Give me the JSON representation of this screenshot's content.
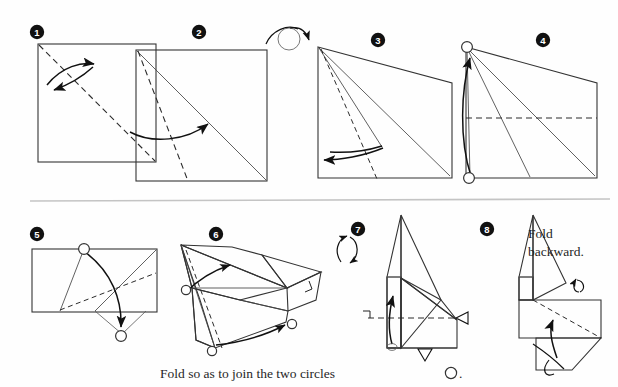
{
  "figure": {
    "type": "origami-diagram",
    "step_count": 8,
    "background_color": "#fefefe",
    "paper_front_color": "#ffffff",
    "paper_back_color": "#c8c8c8",
    "line_color": "#333333",
    "divider_color": "#c4c4c4"
  },
  "steps": [
    {
      "number": "1",
      "badge": "❶",
      "shape": "square",
      "description": "Square sheet with dashed diagonal valley fold from top-left to bottom-right; curved arrow folds corner over.",
      "markers": [],
      "arrows": [
        "double-curve-left"
      ]
    },
    {
      "number": "2",
      "badge": "❷",
      "shape": "square",
      "description": "Square with existing diagonal crease and a new dashed fold line from the top-left corner; curved arrow folds edge to the crease.",
      "markers": [],
      "arrows": [
        "curve-right-up"
      ]
    },
    {
      "number": "3",
      "badge": "❸",
      "shape": "trapezoid",
      "description": "Shaded trapezoid showing the back of the paper; dashed fold line and curved arrow folding a flap to the left.",
      "markers": [],
      "arrows": [
        "curve-left"
      ]
    },
    {
      "number": "4",
      "badge": "❹",
      "shape": "trapezoid",
      "description": "Shaded trapezoid with two open circles at top-left and bottom-left; arrow joins the bottom circle to the top circle; horizontal dashed fold line.",
      "markers": [
        "circle-top-left",
        "circle-bottom-left"
      ],
      "arrows": [
        "curve-up-to-circle"
      ]
    },
    {
      "number": "5",
      "badge": "❺",
      "shape": "rectangle",
      "description": "Horizontal rectangle with an open circle at the top edge and a second open circle below the sheet; arrow joins them. Dashed diagonal fold line present.",
      "markers": [
        "circle-top",
        "circle-bottom"
      ],
      "arrows": [
        "curve-down-to-circle"
      ]
    },
    {
      "number": "6",
      "badge": "❻",
      "shape": "three-dimensional-fold",
      "description": "Partly collapsed three-dimensional model with shaded back surfaces; arrows show flaps swinging, open circles mark the points to be joined, right-angle mark on the right flap.",
      "markers": [
        "circle-left",
        "circle-bottom",
        "circle-right",
        "right-angle"
      ],
      "arrows": [
        "curve-up-left",
        "curve-right-lower"
      ]
    },
    {
      "number": "7",
      "badge": "❼",
      "shape": "folded-model-side-view",
      "description": "Side view of the model with rotate symbol; horizontal dashed fold line with right-angle mark, a hidden-fold arrow pointing up, an open arrowhead at the right and a valley arrowhead at the bottom.",
      "markers": [
        "rotate-symbol",
        "right-angle",
        "open-arrowhead-right",
        "valley-arrowhead-bottom"
      ],
      "arrows": [
        "inside-reverse-up"
      ]
    },
    {
      "number": "8",
      "badge": "❽",
      "shape": "folded-model-side-view",
      "description": "Side view with a dashed mountain fold line running to the lower right; looping arrows indicate folding the flaps behind the model.",
      "markers": [
        "loop-arrow-top",
        "loop-arrow-bottom"
      ],
      "arrows": [
        "fold-back-up",
        "fold-back-loop"
      ],
      "note": "Fold\nbackward."
    }
  ],
  "annotations": {
    "turn_over_symbol": "turn-over-arrow",
    "rotate_symbol": "rotate-arrow",
    "step8_note_line1": "Fold",
    "step8_note_line2": "backward."
  },
  "caption": {
    "text_before_symbol": "Fold so as to join the two circles",
    "symbol": "○",
    "text_after_symbol": "."
  }
}
